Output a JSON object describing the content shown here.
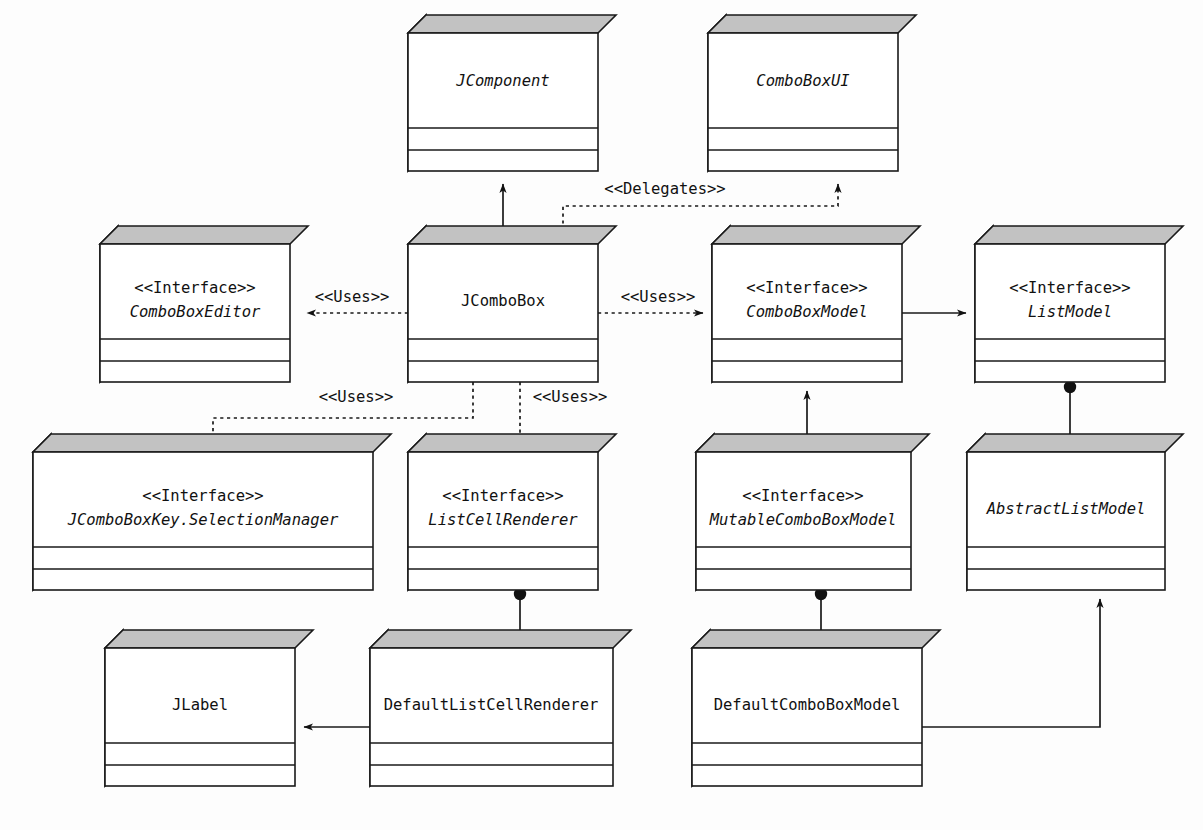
{
  "diagram": {
    "kind": "uml-class-diagram",
    "colors": {
      "box_face": "#ffffff",
      "box_side": "#b9b9b9",
      "box_top": "#c2c2c2",
      "line": "#1a1a1a",
      "background": "#fdfdfd"
    },
    "stereotype_interface": "<<Interface>>",
    "classes": [
      {
        "id": "jcomponent",
        "stereotype": "",
        "name": "JComponent",
        "abstract": true,
        "x": 408,
        "y": 33,
        "w": 190,
        "h": 138
      },
      {
        "id": "comboboxui",
        "stereotype": "",
        "name": "ComboBoxUI",
        "abstract": true,
        "x": 708,
        "y": 33,
        "w": 190,
        "h": 138
      },
      {
        "id": "comboboxeditor",
        "stereotype": "<<Interface>>",
        "name": "ComboBoxEditor",
        "abstract": true,
        "x": 100,
        "y": 244,
        "w": 190,
        "h": 138
      },
      {
        "id": "jcombobox",
        "stereotype": "",
        "name": "JComboBox",
        "abstract": false,
        "x": 408,
        "y": 244,
        "w": 190,
        "h": 138
      },
      {
        "id": "comboboxmodel",
        "stereotype": "<<Interface>>",
        "name": "ComboBoxModel",
        "abstract": true,
        "x": 712,
        "y": 244,
        "w": 190,
        "h": 138
      },
      {
        "id": "listmodel",
        "stereotype": "<<Interface>>",
        "name": "ListModel",
        "abstract": true,
        "x": 975,
        "y": 244,
        "w": 190,
        "h": 138
      },
      {
        "id": "selectionmanager",
        "stereotype": "<<Interface>>",
        "name": "JComboBoxKey.SelectionManager",
        "abstract": true,
        "x": 33,
        "y": 452,
        "w": 340,
        "h": 138
      },
      {
        "id": "listcellrenderer",
        "stereotype": "<<Interface>>",
        "name": "ListCellRenderer",
        "abstract": true,
        "x": 408,
        "y": 452,
        "w": 190,
        "h": 138
      },
      {
        "id": "mutablecomboboxmodel",
        "stereotype": "<<Interface>>",
        "name": "MutableComboBoxModel",
        "abstract": true,
        "x": 696,
        "y": 452,
        "w": 215,
        "h": 138
      },
      {
        "id": "abstractlistmodel",
        "stereotype": "",
        "name": "AbstractListModel",
        "abstract": true,
        "x": 967,
        "y": 452,
        "w": 198,
        "h": 138
      },
      {
        "id": "jlabel",
        "stereotype": "",
        "name": "JLabel",
        "abstract": false,
        "x": 105,
        "y": 648,
        "w": 190,
        "h": 138
      },
      {
        "id": "defaultlistcellrenderer",
        "stereotype": "",
        "name": "DefaultListCellRenderer",
        "abstract": false,
        "x": 370,
        "y": 648,
        "w": 243,
        "h": 138
      },
      {
        "id": "defaultcomboboxmodel",
        "stereotype": "",
        "name": "DefaultComboBoxModel",
        "abstract": false,
        "x": 692,
        "y": 648,
        "w": 230,
        "h": 138
      }
    ],
    "relationships": [
      {
        "id": "jcombobox-extends-jcomponent",
        "from": "jcombobox",
        "to": "jcomponent",
        "kind": "generalization",
        "style": "solid",
        "label": ""
      },
      {
        "id": "jcombobox-delegates-comboboxui",
        "from": "jcombobox",
        "to": "comboboxui",
        "kind": "dependency",
        "style": "dashed",
        "label": "<<Delegates>>"
      },
      {
        "id": "jcombobox-uses-comboboxeditor",
        "from": "jcombobox",
        "to": "comboboxeditor",
        "kind": "dependency",
        "style": "dashed",
        "label": "<<Uses>>"
      },
      {
        "id": "jcombobox-uses-comboboxmodel",
        "from": "jcombobox",
        "to": "comboboxmodel",
        "kind": "dependency",
        "style": "dashed",
        "label": "<<Uses>>"
      },
      {
        "id": "jcombobox-uses-selectionmanager",
        "from": "jcombobox",
        "to": "selectionmanager",
        "kind": "dependency",
        "style": "dashed",
        "label": "<<Uses>>"
      },
      {
        "id": "jcombobox-uses-listcellrenderer",
        "from": "jcombobox",
        "to": "listcellrenderer",
        "kind": "dependency",
        "style": "dashed",
        "label": "<<Uses>>"
      },
      {
        "id": "comboboxmodel-extends-listmodel",
        "from": "comboboxmodel",
        "to": "listmodel",
        "kind": "association",
        "style": "solid",
        "label": ""
      },
      {
        "id": "mutablecomboboxmodel-extends-comboboxmodel",
        "from": "mutablecomboboxmodel",
        "to": "comboboxmodel",
        "kind": "generalization",
        "style": "solid",
        "label": ""
      },
      {
        "id": "listmodel-realization-abstractlistmodel",
        "from": "abstractlistmodel",
        "to": "listmodel",
        "kind": "realization-ball",
        "style": "solid",
        "label": ""
      },
      {
        "id": "defaultlistcellrenderer-realizes-listcellrenderer",
        "from": "defaultlistcellrenderer",
        "to": "listcellrenderer",
        "kind": "realization-ball",
        "style": "solid",
        "label": ""
      },
      {
        "id": "defaultcomboboxmodel-realizes-mutablecomboboxmodel",
        "from": "defaultcomboboxmodel",
        "to": "mutablecomboboxmodel",
        "kind": "realization-ball",
        "style": "solid",
        "label": ""
      },
      {
        "id": "defaultcomboboxmodel-extends-abstractlistmodel",
        "from": "defaultcomboboxmodel",
        "to": "abstractlistmodel",
        "kind": "generalization",
        "style": "solid",
        "label": ""
      },
      {
        "id": "defaultlistcellrenderer-extends-jlabel",
        "from": "defaultlistcellrenderer",
        "to": "jlabel",
        "kind": "association",
        "style": "solid",
        "label": ""
      }
    ],
    "edge_labels": [
      {
        "id": "lbl-delegates",
        "text": "<<Delegates>>",
        "x": 665,
        "y": 189
      },
      {
        "id": "lbl-uses-editor",
        "text": "<<Uses>>",
        "x": 352,
        "y": 297
      },
      {
        "id": "lbl-uses-model",
        "text": "<<Uses>>",
        "x": 658,
        "y": 297
      },
      {
        "id": "lbl-uses-selmgr",
        "text": "<<Uses>>",
        "x": 356,
        "y": 397
      },
      {
        "id": "lbl-uses-renderer",
        "text": "<<Uses>>",
        "x": 570,
        "y": 397
      }
    ]
  }
}
